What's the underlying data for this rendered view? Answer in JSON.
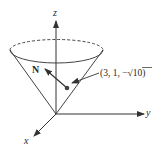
{
  "diagram": {
    "type": "cone-surface-normal",
    "axes": {
      "z_label": "z",
      "y_label": "y",
      "x_label": "x"
    },
    "normal_label": "N",
    "point": {
      "label_prefix": "(3, 1, −",
      "sqrt_symbol": "√",
      "radicand": "10",
      "label_suffix": ")"
    },
    "colors": {
      "line": "#333333",
      "background": "#ffffff"
    }
  }
}
